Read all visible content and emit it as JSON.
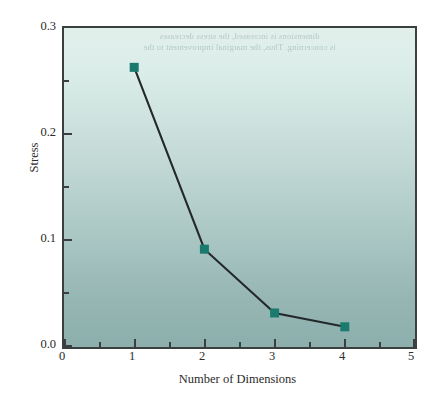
{
  "chart_data": {
    "type": "line",
    "title": "",
    "xlabel": "Number of Dimensions",
    "ylabel": "Stress",
    "x": [
      1,
      2,
      3,
      4
    ],
    "values": [
      0.263,
      0.092,
      0.032,
      0.019
    ],
    "series": [
      {
        "name": "Stress",
        "x": [
          1,
          2,
          3,
          4
        ],
        "values": [
          0.263,
          0.092,
          0.032,
          0.019
        ]
      }
    ],
    "xlim": [
      0,
      5
    ],
    "ylim": [
      0.0,
      0.3
    ],
    "xticks": [
      0,
      1,
      2,
      3,
      4,
      5
    ],
    "xtick_labels": [
      "0",
      "1",
      "2",
      "3",
      "4",
      "5"
    ],
    "x_minor_ticks": [
      0.5,
      1.5,
      2.5,
      3.5,
      4.5
    ],
    "yticks": [
      0.0,
      0.1,
      0.2,
      0.3
    ],
    "ytick_labels": [
      "0.0",
      "0.1",
      "0.2",
      "0.3"
    ],
    "y_minor_ticks": [
      0.05,
      0.15,
      0.25
    ],
    "grid": false,
    "legend": "none",
    "marker": "square",
    "marker_color": "#1a7a6e",
    "line_color": "#23282a",
    "plot_bg_top": "#e2efeb",
    "plot_bg_bottom": "#8cafad",
    "frame_color": "#3a3f40",
    "annotations": []
  },
  "bleed_text": {
    "line1": "dimensions is increased, the stress decreases",
    "line2": "is concerning. Thus, the marginal improvement to the"
  }
}
